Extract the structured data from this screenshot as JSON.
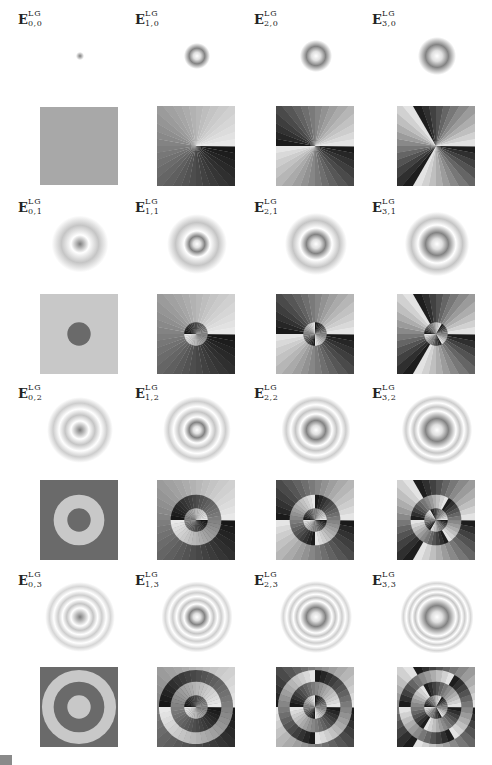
{
  "figure": {
    "columns": [
      0,
      1,
      2,
      3
    ],
    "rows": [
      0,
      1,
      2,
      3
    ],
    "labels": [
      {
        "base": "E",
        "sup": "LG",
        "sub": "0,0"
      },
      {
        "base": "E",
        "sup": "LG",
        "sub": "1,0"
      },
      {
        "base": "E",
        "sup": "LG",
        "sub": "2,0"
      },
      {
        "base": "E",
        "sup": "LG",
        "sub": "3,0"
      },
      {
        "base": "E",
        "sup": "LG",
        "sub": "0,1"
      },
      {
        "base": "E",
        "sup": "LG",
        "sub": "1,1"
      },
      {
        "base": "E",
        "sup": "LG",
        "sub": "2,1"
      },
      {
        "base": "E",
        "sup": "LG",
        "sub": "3,1"
      },
      {
        "base": "E",
        "sup": "LG",
        "sub": "0,2"
      },
      {
        "base": "E",
        "sup": "LG",
        "sub": "1,2"
      },
      {
        "base": "E",
        "sup": "LG",
        "sub": "2,2"
      },
      {
        "base": "E",
        "sup": "LG",
        "sub": "3,2"
      },
      {
        "base": "E",
        "sup": "LG",
        "sub": "0,3"
      },
      {
        "base": "E",
        "sup": "LG",
        "sub": "1,3"
      },
      {
        "base": "E",
        "sup": "LG",
        "sub": "2,3"
      },
      {
        "base": "E",
        "sup": "LG",
        "sub": "3,3"
      }
    ],
    "panel_types": [
      "amplitude",
      "phase"
    ],
    "colormap": "grayscale",
    "caption_text": ""
  }
}
